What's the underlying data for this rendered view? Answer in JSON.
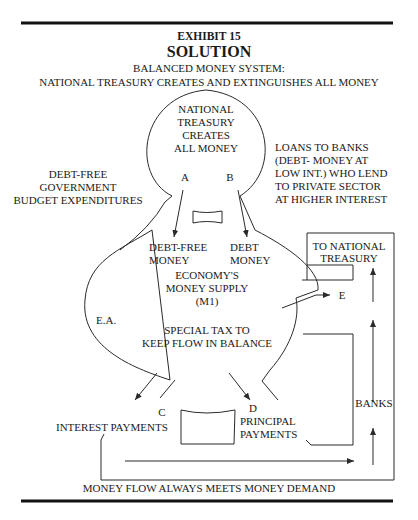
{
  "header": {
    "exhibit": "EXHIBIT 15",
    "title": "SOLUTION",
    "subtitle_1": "BALANCED MONEY SYSTEM:",
    "subtitle_2": "NATIONAL TREASURY CREATES  AND EXTINGUISHES ALL MONEY"
  },
  "treasury": {
    "line1": "NATIONAL",
    "line2": "TREASURY",
    "line3": "CREATES",
    "line4": "ALL MONEY"
  },
  "points": {
    "a": "A",
    "b": "B",
    "c": "C",
    "d": "D",
    "e": "E",
    "ea": "E.A."
  },
  "left_note": {
    "line1": "DEBT-FREE",
    "line2": "GOVERNMENT",
    "line3": "BUDGET EXPENDITURES"
  },
  "right_note": {
    "line1": "LOANS TO BANKS",
    "line2": "(DEBT- MONEY AT",
    "line3": "LOW INT.) WHO LEND",
    "line4": "TO PRIVATE SECTOR",
    "line5": "AT HIGHER INTEREST"
  },
  "economy": {
    "debt_free_1": "DEBT-FREE",
    "debt_free_2": "MONEY",
    "debt_1": "DEBT",
    "debt_2": "MONEY",
    "supply_1": "ECONOMY'S",
    "supply_2": "MONEY SUPPLY",
    "supply_3": "(M1)",
    "tax_1": "SPECIAL TAX TO",
    "tax_2": "KEEP FLOW IN BALANCE"
  },
  "return_box": {
    "line1": "TO NATIONAL",
    "line2": "TREASURY"
  },
  "banks_label": "BANKS",
  "interest_label": "INTEREST PAYMENTS",
  "principal": {
    "line1": "PRINCIPAL",
    "line2": "PAYMENTS"
  },
  "footer": "MONEY FLOW ALWAYS MEETS MONEY DEMAND"
}
